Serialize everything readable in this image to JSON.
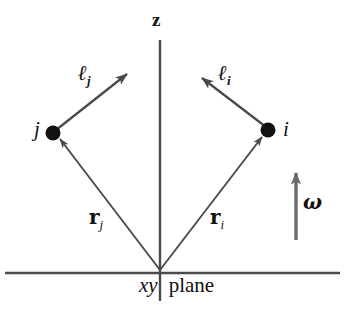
{
  "figure": {
    "type": "vector-diagram",
    "background_color": "#ffffff",
    "line_color": "#4a4a4a",
    "axis_color": "#4a4a4a",
    "text_color": "#111111"
  },
  "labels": {
    "z_axis": "z",
    "particle_i": "i",
    "particle_j": "j",
    "ell_i_base": "ℓ",
    "ell_i_sub": "i",
    "ell_j_base": "ℓ",
    "ell_j_sub": "j",
    "r_i_base": "r",
    "r_i_sub": "i",
    "r_j_base": "r",
    "r_j_sub": "j",
    "omega": "ω",
    "plane_xy": "xy",
    "plane_word": "plane"
  },
  "geometry": {
    "origin": {
      "x": 160,
      "y": 272
    },
    "z_axis": {
      "x": 160,
      "y_top": 40,
      "y_bottom": 301
    },
    "xy_plane_line": {
      "x_start": 5,
      "x_end": 340,
      "y": 273
    },
    "particle_i_dot": {
      "x": 268,
      "y": 130,
      "r": 7
    },
    "particle_j_dot": {
      "x": 53,
      "y": 133,
      "r": 7
    },
    "r_i_vector": {
      "x1": 160,
      "y1": 270,
      "x2": 262,
      "y2": 137
    },
    "r_j_vector": {
      "x1": 160,
      "y1": 270,
      "x2": 60,
      "y2": 139
    },
    "ell_i_vector": {
      "x1": 266,
      "y1": 127,
      "x2": 201,
      "y2": 78
    },
    "ell_j_vector": {
      "x1": 56,
      "y1": 130,
      "x2": 127,
      "y2": 73
    },
    "omega_vector": {
      "x1": 296,
      "y1": 240,
      "x2": 296,
      "y2": 172
    }
  }
}
